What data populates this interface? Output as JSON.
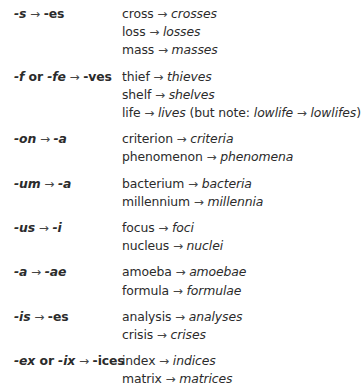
{
  "rules": [
    {
      "label": [
        {
          "text": "-s",
          "style": "it"
        },
        {
          "text": " → ",
          "style": "arrow"
        },
        {
          "text": "-es",
          "style": "rm"
        }
      ],
      "examples": [
        {
          "singular": "cross",
          "plural": "crosses",
          "note": ""
        },
        {
          "singular": "loss",
          "plural": "losses",
          "note": ""
        },
        {
          "singular": "mass",
          "plural": "masses",
          "note": ""
        }
      ]
    },
    {
      "label": [
        {
          "text": "-f",
          "style": "it"
        },
        {
          "text": " or ",
          "style": "rm"
        },
        {
          "text": "-fe",
          "style": "it"
        },
        {
          "text": " → ",
          "style": "arrow"
        },
        {
          "text": "-ves",
          "style": "rm"
        }
      ],
      "examples": [
        {
          "singular": "thief",
          "plural": "thieves",
          "note": ""
        },
        {
          "singular": "shelf",
          "plural": "shelves",
          "note": ""
        },
        {
          "singular": "life",
          "plural": "lives",
          "note": {
            "prefix": " (but note: ",
            "from": "lowlife",
            "to": "lowlifes",
            "suffix": ")"
          }
        }
      ]
    },
    {
      "label": [
        {
          "text": "-on",
          "style": "it"
        },
        {
          "text": " → ",
          "style": "arrow"
        },
        {
          "text": "-a",
          "style": "it"
        }
      ],
      "examples": [
        {
          "singular": "criterion",
          "plural": "criteria",
          "note": ""
        },
        {
          "singular": "phenomenon",
          "plural": "phenomena",
          "note": ""
        }
      ]
    },
    {
      "label": [
        {
          "text": "-um",
          "style": "it"
        },
        {
          "text": " → ",
          "style": "arrow"
        },
        {
          "text": "-a",
          "style": "it"
        }
      ],
      "examples": [
        {
          "singular": "bacterium",
          "plural": "bacteria",
          "note": ""
        },
        {
          "singular": "millennium",
          "plural": "millennia",
          "note": ""
        }
      ]
    },
    {
      "label": [
        {
          "text": "-us",
          "style": "it"
        },
        {
          "text": " → ",
          "style": "arrow"
        },
        {
          "text": "-i",
          "style": "it"
        }
      ],
      "examples": [
        {
          "singular": "focus",
          "plural": "foci",
          "note": ""
        },
        {
          "singular": "nucleus",
          "plural": "nuclei",
          "note": ""
        }
      ]
    },
    {
      "label": [
        {
          "text": "-a",
          "style": "it"
        },
        {
          "text": " → ",
          "style": "arrow"
        },
        {
          "text": "-ae",
          "style": "it"
        }
      ],
      "examples": [
        {
          "singular": "amoeba",
          "plural": "amoebae",
          "note": ""
        },
        {
          "singular": "formula",
          "plural": "formulae",
          "note": ""
        }
      ]
    },
    {
      "label": [
        {
          "text": "-is",
          "style": "it"
        },
        {
          "text": " → ",
          "style": "arrow"
        },
        {
          "text": "-es",
          "style": "rm"
        }
      ],
      "examples": [
        {
          "singular": "analysis",
          "plural": "analyses",
          "note": ""
        },
        {
          "singular": "crisis",
          "plural": "crises",
          "note": ""
        }
      ]
    },
    {
      "label": [
        {
          "text": "-ex",
          "style": "it"
        },
        {
          "text": " or ",
          "style": "rm"
        },
        {
          "text": "-ix",
          "style": "it"
        },
        {
          "text": " → ",
          "style": "arrow"
        },
        {
          "text": "-ices",
          "style": "rm"
        }
      ],
      "examples": [
        {
          "singular": "index",
          "plural": "indices",
          "note": ""
        },
        {
          "singular": "matrix",
          "plural": "matrices",
          "note": ""
        }
      ]
    }
  ],
  "arrow_glyph": " → "
}
